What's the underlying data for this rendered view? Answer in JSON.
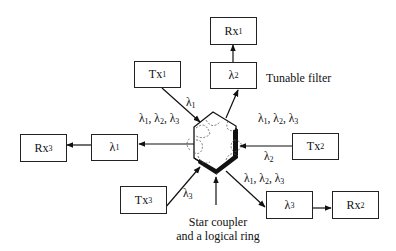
{
  "diagram": {
    "title_caption": "Star coupler and a logical ring",
    "center": {
      "label_line1": "Star coupler",
      "label_line2": "and a logical ring"
    },
    "nodes": {
      "tx1": {
        "base": "Tx",
        "sub": "1"
      },
      "tx2": {
        "base": "Tx",
        "sub": "2"
      },
      "tx3": {
        "base": "Tx",
        "sub": "3"
      },
      "rx1": {
        "base": "Rx",
        "sub": "1"
      },
      "rx2": {
        "base": "Rx",
        "sub": "2"
      },
      "rx3": {
        "base": "Rx",
        "sub": "3"
      },
      "filter1": {
        "base": "λ",
        "sub": "2"
      },
      "filter2": {
        "base": "λ",
        "sub": "3"
      },
      "filter3": {
        "base": "λ",
        "sub": "1"
      }
    },
    "annotations": {
      "tunable_filter": "Tunable filter",
      "tx1_wavelength": {
        "base": "λ",
        "sub": "1"
      },
      "tx2_wavelength": {
        "base": "λ",
        "sub": "2"
      },
      "tx3_wavelength": {
        "base": "λ",
        "sub": "3"
      },
      "all_wavelengths": "λ1, λ2, λ3"
    },
    "edges": [
      {
        "from": "tx1",
        "to": "star_coupler",
        "label": "λ1"
      },
      {
        "from": "tx2",
        "to": "star_coupler",
        "label": "λ2"
      },
      {
        "from": "tx3",
        "to": "star_coupler",
        "label": "λ3"
      },
      {
        "from": "star_coupler",
        "to": "filter1",
        "label": "λ1, λ2, λ3"
      },
      {
        "from": "star_coupler",
        "to": "filter2",
        "label": "λ1, λ2, λ3"
      },
      {
        "from": "star_coupler",
        "to": "filter3",
        "label": "λ1, λ2, λ3"
      },
      {
        "from": "filter1",
        "to": "rx1"
      },
      {
        "from": "filter2",
        "to": "rx2"
      },
      {
        "from": "filter3",
        "to": "rx3"
      }
    ]
  }
}
